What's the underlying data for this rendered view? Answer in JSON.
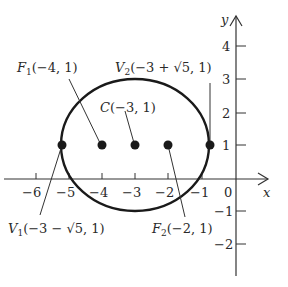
{
  "figure": {
    "type": "ellipse-diagram",
    "axes": {
      "x_label": "x",
      "y_label": "y",
      "x_ticks": [
        "−6",
        "−5",
        "−4",
        "−3",
        "−2",
        "−1",
        "0"
      ],
      "y_ticks_pos": [
        "1",
        "2",
        "3",
        "4"
      ],
      "y_ticks_neg": [
        "−1",
        "−2"
      ]
    },
    "ellipse": {
      "center": [
        -3,
        1
      ],
      "semi_major": 2.236,
      "semi_minor": 2
    },
    "points": [
      {
        "id": "V1",
        "letter": "V",
        "sub": "1",
        "coords": "(−3 − √5, 1)",
        "x": -5.236,
        "y": 1
      },
      {
        "id": "F1",
        "letter": "F",
        "sub": "1",
        "coords": "(−4, 1)",
        "x": -4,
        "y": 1
      },
      {
        "id": "C",
        "letter": "C",
        "sub": "",
        "coords": "(−3, 1)",
        "x": -3,
        "y": 1
      },
      {
        "id": "F2",
        "letter": "F",
        "sub": "2",
        "coords": "(−2, 1)",
        "x": -2,
        "y": 1
      },
      {
        "id": "V2",
        "letter": "V",
        "sub": "2",
        "coords": "(−3 + √5, 1)",
        "x": -0.764,
        "y": 1
      }
    ]
  }
}
